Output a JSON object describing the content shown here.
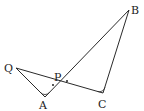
{
  "diagram": {
    "type": "geometry",
    "points": {
      "Q": {
        "label": "Q",
        "x": 16,
        "y": 68
      },
      "A": {
        "label": "A",
        "x": 45,
        "y": 97
      },
      "P": {
        "label": "P",
        "x": 58,
        "y": 84
      },
      "C": {
        "label": "C",
        "x": 103,
        "y": 93
      },
      "B": {
        "label": "B",
        "x": 129,
        "y": 10
      }
    },
    "segments": [
      "QA",
      "QC",
      "AB",
      "BC"
    ],
    "angle_marks": [
      "angle-A",
      "angle-C"
    ],
    "equal_angle_dots": [
      "dot-left-of-P",
      "dot-right-of-P"
    ],
    "colors": {
      "stroke": "#2a2a2a",
      "label": "#222222",
      "background": "#ffffff"
    }
  },
  "labels": {
    "Q": "Q",
    "A": "A",
    "P": "P",
    "C": "C",
    "B": "B"
  }
}
